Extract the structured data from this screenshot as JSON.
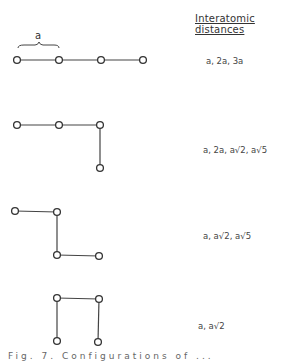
{
  "heading": "Interatomic distances",
  "brace_label": "a",
  "configurations": [
    {
      "id": "linear",
      "distances": "a, 2a, 3a",
      "nodes": [
        [
          17,
          60
        ],
        [
          59,
          60
        ],
        [
          101,
          60
        ],
        [
          143,
          60
        ]
      ],
      "bonds": [
        [
          0,
          1
        ],
        [
          1,
          2
        ],
        [
          2,
          3
        ]
      ]
    },
    {
      "id": "bent-end",
      "distances": "a, 2a, a√2, a√5",
      "nodes": [
        [
          17,
          125
        ],
        [
          59,
          125
        ],
        [
          100,
          125
        ],
        [
          100,
          168
        ]
      ],
      "bonds": [
        [
          0,
          1
        ],
        [
          1,
          2
        ],
        [
          2,
          3
        ]
      ]
    },
    {
      "id": "zigzag",
      "distances": "a, a√2, a√5",
      "nodes": [
        [
          15,
          211
        ],
        [
          57,
          212
        ],
        [
          57,
          255
        ],
        [
          99,
          256
        ]
      ],
      "bonds": [
        [
          0,
          1
        ],
        [
          1,
          2
        ],
        [
          2,
          3
        ]
      ]
    },
    {
      "id": "u-shape",
      "distances": "a, a√2",
      "nodes": [
        [
          57,
          298
        ],
        [
          99,
          299
        ],
        [
          57,
          341
        ],
        [
          98,
          342
        ]
      ],
      "bonds": [
        [
          0,
          1
        ],
        [
          0,
          2
        ],
        [
          1,
          3
        ]
      ]
    }
  ],
  "caption": "Fig. 7. Configurations of ..."
}
